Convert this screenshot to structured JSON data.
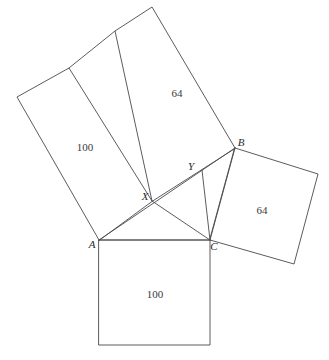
{
  "figure": {
    "width": 329,
    "height": 360,
    "stroke_color": "#4a4a4a",
    "background_color": "#ffffff",
    "text_color": "#2b2b2b"
  },
  "points": {
    "A": {
      "label": "A",
      "x": 99,
      "y": 240,
      "label_x": 92,
      "label_y": 245
    },
    "B": {
      "label": "B",
      "x": 235,
      "y": 148,
      "label_x": 241,
      "label_y": 143
    },
    "C": {
      "label": "C",
      "x": 210,
      "y": 240,
      "label_x": 214,
      "label_y": 247
    },
    "X": {
      "label": "X",
      "x": 152,
      "y": 201,
      "label_x": 145,
      "label_y": 197
    },
    "Y": {
      "label": "Y",
      "x": 202,
      "y": 170,
      "label_x": 191,
      "label_y": 167
    }
  },
  "squares": [
    {
      "name": "square-on-AC-bottom",
      "area_label": "100",
      "label_x": 155,
      "label_y": 295,
      "vertices": "99,240 210,240 210,345 99,345"
    },
    {
      "name": "square-on-BC-right",
      "area_label": "64",
      "label_x": 262,
      "label_y": 211,
      "vertices": "235,148 318,174 294,264 210,240"
    },
    {
      "name": "square-on-AB-upper-large",
      "area_label": "100",
      "label_x": 85,
      "label_y": 148,
      "vertices": "99,240 17,97 69,68 152,201"
    },
    {
      "name": "square-on-AB-upper-small",
      "area_label": "64",
      "label_x": 177,
      "label_y": 94,
      "vertices": "152,201 115,31 152,7 235,148"
    }
  ],
  "segments": [
    {
      "name": "segment-AC",
      "x1": 99,
      "y1": 240,
      "x2": 210,
      "y2": 240
    },
    {
      "name": "segment-AB",
      "x1": 99,
      "y1": 240,
      "x2": 235,
      "y2": 148
    },
    {
      "name": "segment-BC",
      "x1": 235,
      "y1": 148,
      "x2": 210,
      "y2": 240
    },
    {
      "name": "segment-CX",
      "x1": 210,
      "y1": 240,
      "x2": 152,
      "y2": 201
    },
    {
      "name": "segment-CY",
      "x1": 210,
      "y1": 240,
      "x2": 202,
      "y2": 170
    },
    {
      "name": "segment-divider-upper",
      "x1": 69,
      "y1": 68,
      "x2": 115,
      "y2": 31
    }
  ],
  "outlines": [
    {
      "name": "outline-upper-composite",
      "points": "99,240 17,97 69,68 115,31 152,7 235,148"
    },
    {
      "name": "outline-upper-divider-X",
      "points": "69,68 152,201"
    },
    {
      "name": "outline-upper-divider-Y",
      "points": "115,31 202,170"
    }
  ]
}
